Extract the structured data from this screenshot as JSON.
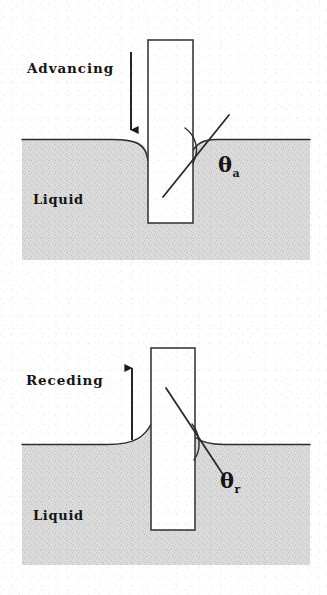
{
  "figure": {
    "background_color": "#ffffff",
    "ink_color": "#141414",
    "liquid_fill_color": "#d9d9d9"
  },
  "panels": [
    {
      "id": "advancing",
      "motion_label": "Advancing",
      "liquid_label": "Liquid",
      "angle_symbol": "θ",
      "angle_subscript": "a",
      "arrow_direction": "down",
      "arrow_name": "down-arrow",
      "meniscus_shape": "depressed",
      "plate": {
        "x": 148,
        "y": 40,
        "width": 45,
        "height": 183
      },
      "liquid_block": {
        "x": 22,
        "y": 140,
        "width": 288,
        "height": 120
      },
      "surface_y": 140,
      "contact_point": {
        "x": 193,
        "y": 150
      },
      "tangent_line": {
        "x1": 163,
        "y1": 197,
        "x2": 229,
        "y2": 115
      },
      "angle_label_pos": {
        "x": 222,
        "y": 152
      },
      "motion_label_pos": {
        "x": 27,
        "y": 60
      },
      "liquid_label_pos": {
        "x": 33,
        "y": 192
      },
      "arrow": {
        "x": 131,
        "y_start": 52,
        "y_end": 139
      }
    },
    {
      "id": "receding",
      "motion_label": "Receding",
      "liquid_label": "Liquid",
      "angle_symbol": "θ",
      "angle_subscript": "r",
      "arrow_direction": "up",
      "arrow_name": "up-arrow",
      "meniscus_shape": "elevated",
      "plate": {
        "x": 151,
        "y": 348,
        "width": 44,
        "height": 182
      },
      "liquid_block": {
        "x": 22,
        "y": 444,
        "width": 288,
        "height": 121
      },
      "surface_y": 444,
      "contact_point": {
        "x": 195,
        "y": 437
      },
      "tangent_line": {
        "x1": 166,
        "y1": 388,
        "x2": 224,
        "y2": 476
      },
      "angle_label_pos": {
        "x": 224,
        "y": 470
      },
      "motion_label_pos": {
        "x": 26,
        "y": 372
      },
      "liquid_label_pos": {
        "x": 33,
        "y": 508
      },
      "arrow": {
        "x": 132,
        "y_start": 440,
        "y_end": 360
      }
    }
  ]
}
